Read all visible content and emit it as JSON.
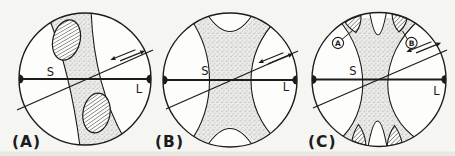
{
  "figure": {
    "panels": [
      {
        "caption": "(A)",
        "s_label": "S",
        "l_label": "L"
      },
      {
        "caption": "(B)",
        "s_label": "S",
        "l_label": "L"
      },
      {
        "caption": "(C)",
        "s_label": "S",
        "l_label": "L",
        "callouts": [
          {
            "label": "A"
          },
          {
            "label": "B"
          }
        ]
      }
    ],
    "colors": {
      "ink": "#1c1c1c",
      "paper": "#f5f5f2",
      "stipple_bg": "#ebebe7",
      "stipple_dot": "#8f8f8b"
    }
  }
}
